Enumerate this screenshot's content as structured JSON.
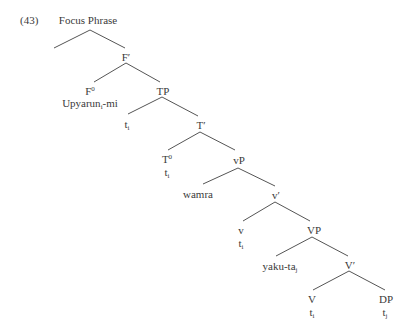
{
  "example_number": "(43)",
  "tree": {
    "root": {
      "label": "Focus Phrase"
    },
    "nodes": {
      "F_bar": {
        "label": "F",
        "prime": "′"
      },
      "F0": {
        "label": "F",
        "sup": "0"
      },
      "F0_word": {
        "base": "Upyarun",
        "sub": "i",
        "suffix": "-mi"
      },
      "TP": {
        "label": "TP"
      },
      "TP_spec": {
        "base": "t",
        "sub": "i"
      },
      "T_bar": {
        "label": "T",
        "prime": "′"
      },
      "T0": {
        "label": "T",
        "sup": "0"
      },
      "T0_trace": {
        "base": "t",
        "sub": "i"
      },
      "vP": {
        "label": "vP"
      },
      "vP_spec": {
        "label": "wamra"
      },
      "v_bar": {
        "label": "v",
        "prime": "′"
      },
      "v": {
        "label": "v"
      },
      "v_trace": {
        "base": "t",
        "sub": "i"
      },
      "VP": {
        "label": "VP"
      },
      "VP_spec": {
        "base": "yaku-ta",
        "sub": "j"
      },
      "V_bar": {
        "label": "V",
        "prime": "′"
      },
      "V": {
        "label": "V"
      },
      "V_trace": {
        "base": "t",
        "sub": "i"
      },
      "DP": {
        "label": "DP"
      },
      "DP_trace": {
        "base": "t",
        "sub": "j"
      }
    }
  },
  "colors": {
    "line": "#555555",
    "text": "#3a3a3a"
  }
}
